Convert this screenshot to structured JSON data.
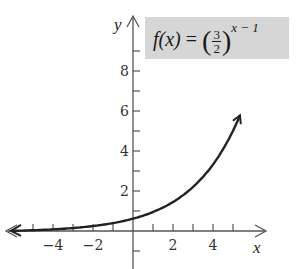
{
  "chart_data": {
    "type": "line",
    "function": "f(x) = (3/2)^(x-1)",
    "xlabel": "x",
    "ylabel": "y",
    "x_ticks": [
      -4,
      -2,
      2,
      4
    ],
    "y_ticks": [
      2,
      4,
      6,
      8
    ],
    "xlim": [
      -6.3,
      6.7
    ],
    "ylim": [
      -1.8,
      10.5
    ],
    "grid": false,
    "legend": "formula box top-right",
    "series": [
      {
        "name": "f(x)",
        "x": [
          -6,
          -5,
          -4,
          -3,
          -2,
          -1,
          0,
          1,
          2,
          3,
          4,
          5,
          5.3
        ],
        "y": [
          0.059,
          0.088,
          0.132,
          0.198,
          0.296,
          0.444,
          0.667,
          1.0,
          1.5,
          2.25,
          3.375,
          5.063,
          6.2
        ]
      }
    ]
  },
  "labels": {
    "x_axis": "x",
    "y_axis": "y",
    "x_tick_labels": [
      "−4",
      "−2",
      "2",
      "4"
    ],
    "y_tick_labels": [
      "8",
      "6",
      "4",
      "2"
    ]
  },
  "formula": {
    "lhs": "f(x)",
    "eq": "=",
    "num": "3",
    "den": "2",
    "exponent": "x − 1"
  },
  "colors": {
    "curve": "#222222",
    "axis": "#555555",
    "formula_bg": "#d6d6d6"
  }
}
